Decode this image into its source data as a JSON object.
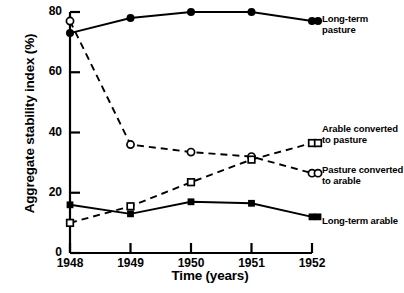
{
  "chart_data": {
    "type": "line",
    "title": "",
    "xlabel": "Time (years)",
    "ylabel": "Aggregate stability index (%)",
    "x": [
      1948,
      1949,
      1950,
      1951,
      1952
    ],
    "xtick_labels": [
      "1948",
      "1949",
      "1950",
      "1951",
      "1952"
    ],
    "ytick_labels": [
      "0",
      "20",
      "40",
      "60",
      "80"
    ],
    "yticks": [
      0,
      20,
      40,
      60,
      80
    ],
    "xlim": [
      1948,
      1952
    ],
    "ylim": [
      0,
      80
    ],
    "grid": false,
    "legend_position": "inline-right",
    "series": [
      {
        "name": "Long-term pasture",
        "values": [
          73,
          78,
          80,
          80,
          77
        ],
        "line": "solid",
        "marker": "filled-circle",
        "color": "#000000"
      },
      {
        "name": "Pasture converted to arable",
        "values": [
          77,
          36,
          33.5,
          32,
          26.5
        ],
        "line": "dashed",
        "marker": "open-circle",
        "color": "#000000"
      },
      {
        "name": "Arable converted to pasture",
        "values": [
          10,
          15.5,
          23.5,
          31,
          36.5
        ],
        "line": "dashed",
        "marker": "open-square",
        "color": "#000000"
      },
      {
        "name": "Long-term arable",
        "values": [
          16,
          13,
          17,
          16.5,
          12
        ],
        "line": "solid",
        "marker": "filled-square",
        "color": "#000000"
      }
    ]
  },
  "labels": {
    "long_term_pasture": "Long-term pasture",
    "arable_converted": "Arable converted\nto pasture",
    "pasture_converted": "Pasture converted\nto arable",
    "long_term_arable": "Long-term arable"
  }
}
